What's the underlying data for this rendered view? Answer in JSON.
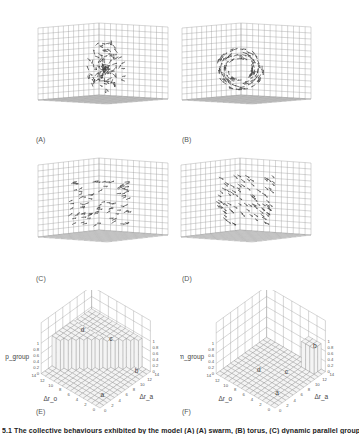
{
  "figure": {
    "panels": [
      {
        "id": "A",
        "label": "(A)",
        "type": "3d-vector-field",
        "description": "random scattered arrows"
      },
      {
        "id": "B",
        "label": "(B)",
        "type": "3d-vector-field",
        "description": "rotating / circular arrows"
      },
      {
        "id": "C",
        "label": "(C)",
        "type": "3d-vector-field",
        "description": "aligned arrows"
      },
      {
        "id": "D",
        "label": "(D)",
        "type": "3d-vector-field",
        "description": "aligned arrows"
      },
      {
        "id": "E",
        "label": "(E)",
        "type": "3d-surface",
        "zlabel": "p_group",
        "xlabel": "Δr_o",
        "ylabel": "Δr_a",
        "z_ticks": [
          "0",
          "0.2",
          "0.4",
          "0.6",
          "0.8",
          "1"
        ],
        "x_ticks": [
          "0",
          "2",
          "4",
          "6",
          "8",
          "10",
          "12",
          "14"
        ],
        "y_ticks": [
          "0",
          "2",
          "4",
          "6",
          "8",
          "10",
          "12",
          "14"
        ],
        "region_markers": [
          "a",
          "b",
          "c",
          "d"
        ]
      },
      {
        "id": "F",
        "label": "(F)",
        "type": "3d-surface",
        "zlabel": "m_group",
        "xlabel": "Δr_o",
        "ylabel": "Δr_a",
        "z_ticks": [
          "0",
          "0.2",
          "0.4",
          "0.6",
          "0.8",
          "1"
        ],
        "x_ticks": [
          "0",
          "2",
          "4",
          "6",
          "8",
          "10",
          "12",
          "14"
        ],
        "y_ticks": [
          "0",
          "2",
          "4",
          "6",
          "8",
          "10",
          "12",
          "14"
        ],
        "region_markers": [
          "a",
          "b",
          "c",
          "d"
        ]
      }
    ],
    "caption": "5.1  The collective behaviours exhibited by the model (A) (A) swarm, (B) torus, (C) dynamic parallel group, (D) highly parallel group"
  },
  "chart_data": [
    {
      "type": "surface",
      "title": "(E)",
      "zlabel": "p_group",
      "xlabel": "Δr_o",
      "ylabel": "Δr_a",
      "zlim": [
        0,
        1
      ],
      "xlim": [
        0,
        14
      ],
      "ylim": [
        0,
        14
      ],
      "regions": {
        "a": "low polarization (swarm)",
        "b": "low",
        "c": "high (~0.9)",
        "d": "high (~1)"
      }
    },
    {
      "type": "surface",
      "title": "(F)",
      "zlabel": "m_group",
      "xlabel": "Δr_o",
      "ylabel": "Δr_a",
      "zlim": [
        0,
        1
      ],
      "xlim": [
        0,
        14
      ],
      "ylim": [
        0,
        14
      ],
      "regions": {
        "a": "low",
        "b": "high (~0.9, torus)",
        "c": "low",
        "d": "low"
      }
    }
  ]
}
